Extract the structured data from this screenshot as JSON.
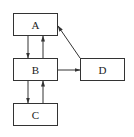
{
  "diagram": {
    "type": "flow",
    "nodes": [
      {
        "id": "A",
        "label": "A",
        "x": 13,
        "y": 13,
        "w": 45,
        "h": 23
      },
      {
        "id": "B",
        "label": "B",
        "x": 13,
        "y": 58,
        "w": 45,
        "h": 23
      },
      {
        "id": "C",
        "label": "C",
        "x": 13,
        "y": 103,
        "w": 45,
        "h": 23
      },
      {
        "id": "D",
        "label": "D",
        "x": 80,
        "y": 58,
        "w": 45,
        "h": 23
      }
    ],
    "edges": [
      {
        "from": "A",
        "to": "B"
      },
      {
        "from": "B",
        "to": "A"
      },
      {
        "from": "B",
        "to": "C"
      },
      {
        "from": "C",
        "to": "B"
      },
      {
        "from": "B",
        "to": "D"
      },
      {
        "from": "D",
        "to": "A"
      }
    ],
    "colors": {
      "stroke": "#333333",
      "background": "#ffffff"
    }
  }
}
